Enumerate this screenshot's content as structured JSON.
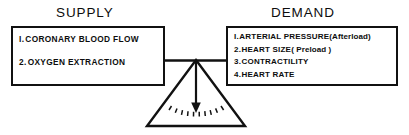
{
  "diagram": {
    "kind": "balance-scale-diagram",
    "ink_color": "#111111",
    "background_color": "#ffffff",
    "supply": {
      "title": "SUPPLY",
      "items": [
        {
          "number": "I.",
          "label": "CORONARY  BLOOD  FLOW"
        },
        {
          "number": "2.",
          "label": "OXYGEN  EXTRACTION"
        }
      ]
    },
    "demand": {
      "title": "DEMAND",
      "items": [
        {
          "number": "I.",
          "label": "ARTERIAL  PRESSURE",
          "note": "(Afterload)"
        },
        {
          "number": "2.",
          "label": "HEART  SIZE",
          "note": "( Preload )"
        },
        {
          "number": "3.",
          "label": "CONTRACTILITY",
          "note": ""
        },
        {
          "number": "4.",
          "label": "HEART  RATE",
          "note": ""
        }
      ]
    },
    "fulcrum": {
      "shape": "triangle",
      "arrow": "down-arrow-at-balance-point",
      "radiating_marks": 10
    }
  }
}
